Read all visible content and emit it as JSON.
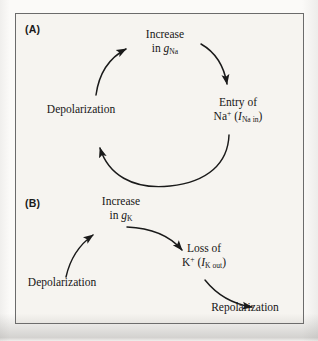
{
  "figure": {
    "background_color": "#f6f4f0",
    "frame_color": "#6b6b6b",
    "ink_color": "#161616"
  },
  "panels": [
    {
      "id": "A",
      "label": "(A)",
      "type": "closed-loop-cycle",
      "description": "Positive feedback cycle of sodium conductance during the rising phase of the action potential",
      "nodes": [
        {
          "id": "increase-gna",
          "line1": "Increase",
          "line2_prefix": "in ",
          "line2_symbol": "g",
          "line2_subscript": "Na",
          "text": "Increase in gNa"
        },
        {
          "id": "entry-of-na",
          "line1": "Entry of",
          "line2_ion": "Na",
          "line2_ion_charge": "+",
          "line2_paren_open": " (",
          "line2_current_symbol": "I",
          "line2_current_subscript": "Na in",
          "line2_paren_close": ")",
          "text": "Entry of Na+ (INa in)"
        },
        {
          "id": "depolarization-a",
          "line1": "Depolarization",
          "text": "Depolarization"
        }
      ],
      "edges": [
        {
          "from": "increase-gna",
          "to": "entry-of-na",
          "style": "curved-arrow"
        },
        {
          "from": "entry-of-na",
          "to": "depolarization-a",
          "style": "curved-arrow"
        },
        {
          "from": "depolarization-a",
          "to": "increase-gna",
          "style": "curved-arrow"
        }
      ]
    },
    {
      "id": "B",
      "label": "(B)",
      "type": "open-cascade",
      "description": "Cascade of potassium conductance leading to repolarization",
      "nodes": [
        {
          "id": "depolarization-b",
          "line1": "Depolarization",
          "text": "Depolarization"
        },
        {
          "id": "increase-gk",
          "line1": "Increase",
          "line2_prefix": "in ",
          "line2_symbol": "g",
          "line2_subscript": "K",
          "text": "Increase in gK"
        },
        {
          "id": "loss-of-k",
          "line1": "Loss of",
          "line2_ion": "K",
          "line2_ion_charge": "+",
          "line2_paren_open": " (",
          "line2_current_symbol": "I",
          "line2_current_subscript": "K out",
          "line2_paren_close": ")",
          "text": "Loss of K+ (IK out)"
        },
        {
          "id": "repolarization",
          "line1": "Repolarization",
          "text": "Repolarization"
        }
      ],
      "edges": [
        {
          "from": "depolarization-b",
          "to": "increase-gk",
          "style": "curved-arrow"
        },
        {
          "from": "increase-gk",
          "to": "loss-of-k",
          "style": "curved-arrow"
        },
        {
          "from": "loss-of-k",
          "to": "repolarization",
          "style": "curved-arrow"
        }
      ]
    }
  ]
}
